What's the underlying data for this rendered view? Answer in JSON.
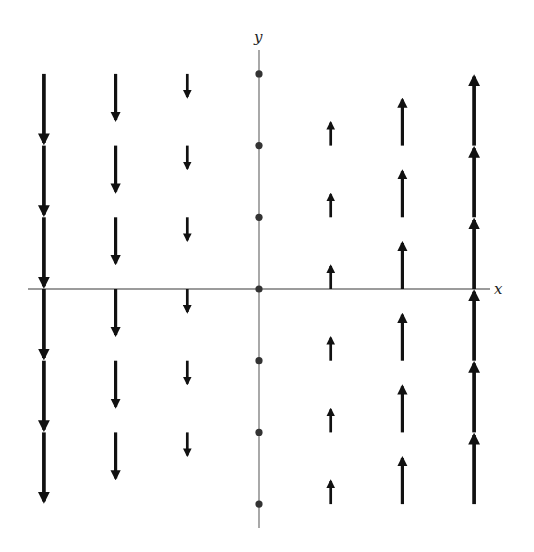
{
  "diagram": {
    "type": "vector_field",
    "field": "F(x, y) = (0, x)",
    "axes": {
      "x_label": "x",
      "y_label": "y",
      "x_range": [
        -3,
        3
      ],
      "y_range": [
        -3,
        3
      ],
      "axis_color": "#7a7a7a"
    },
    "grid": {
      "x_values": [
        -3,
        -2,
        -1,
        0,
        1,
        2,
        3
      ],
      "y_values": [
        3,
        2,
        1,
        0,
        -1,
        -2,
        -3
      ],
      "zero_vector_dots_at_x": 0
    },
    "arrow_color": "#111111",
    "dot_color": "#333333"
  },
  "layout": {
    "origin_px": [
      259,
      289
    ],
    "unit_px": 71.7,
    "arrow_px_per_unit": 23
  }
}
